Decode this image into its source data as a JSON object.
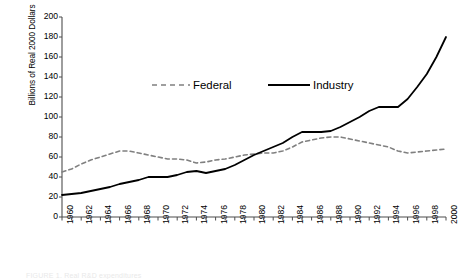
{
  "chart_data": {
    "type": "line",
    "title": "",
    "xlabel": "",
    "ylabel": "Billions of Real 2000 Dollars",
    "xlim": [
      1960,
      2000
    ],
    "ylim": [
      0,
      200
    ],
    "grid": false,
    "legend_position": "upper-center",
    "ytick_labels": [
      "200",
      "180",
      "160",
      "140",
      "120",
      "100",
      "80",
      "60",
      "40",
      "20",
      "0"
    ],
    "ytick_values": [
      200,
      180,
      160,
      140,
      120,
      100,
      80,
      60,
      40,
      20,
      0
    ],
    "xtick_labels": [
      "1960",
      "1962",
      "1964",
      "1966",
      "1968",
      "1970",
      "1972",
      "1974",
      "1976",
      "1978",
      "1980",
      "1982",
      "1984",
      "1986",
      "1988",
      "1990",
      "1992",
      "1994",
      "1996",
      "1998",
      "2000"
    ],
    "xtick_values": [
      1960,
      1962,
      1964,
      1966,
      1968,
      1970,
      1972,
      1974,
      1976,
      1978,
      1980,
      1982,
      1984,
      1986,
      1988,
      1990,
      1992,
      1994,
      1996,
      1998,
      2000
    ],
    "x": [
      1960,
      1961,
      1962,
      1963,
      1964,
      1965,
      1966,
      1967,
      1968,
      1969,
      1970,
      1971,
      1972,
      1973,
      1974,
      1975,
      1976,
      1977,
      1978,
      1979,
      1980,
      1981,
      1982,
      1983,
      1984,
      1985,
      1986,
      1987,
      1988,
      1989,
      1990,
      1991,
      1992,
      1993,
      1994,
      1995,
      1996,
      1997,
      1998,
      1999,
      2000
    ],
    "series": [
      {
        "name": "Federal",
        "color": "#808080",
        "style": "dashed",
        "values": [
          45,
          48,
          53,
          57,
          60,
          63,
          66,
          66,
          64,
          62,
          60,
          58,
          58,
          57,
          54,
          55,
          57,
          58,
          60,
          62,
          63,
          64,
          64,
          66,
          70,
          75,
          77,
          79,
          80,
          80,
          78,
          76,
          74,
          72,
          70,
          66,
          64,
          65,
          66,
          67,
          68
        ]
      },
      {
        "name": "Industry",
        "color": "#000000",
        "style": "solid",
        "values": [
          22,
          23,
          24,
          26,
          28,
          30,
          33,
          35,
          37,
          40,
          40,
          40,
          42,
          45,
          46,
          44,
          46,
          48,
          52,
          57,
          62,
          66,
          70,
          74,
          80,
          85,
          85,
          85,
          86,
          90,
          95,
          100,
          106,
          110,
          110,
          110,
          118,
          130,
          143,
          160,
          180
        ]
      }
    ]
  },
  "legend": {
    "items": [
      {
        "label": "Federal",
        "color": "#808080",
        "style": "dashed"
      },
      {
        "label": "Industry",
        "color": "#000000",
        "style": "solid"
      }
    ]
  },
  "caption": {
    "text": "FIGURE 1. Real R&D expenditures"
  }
}
